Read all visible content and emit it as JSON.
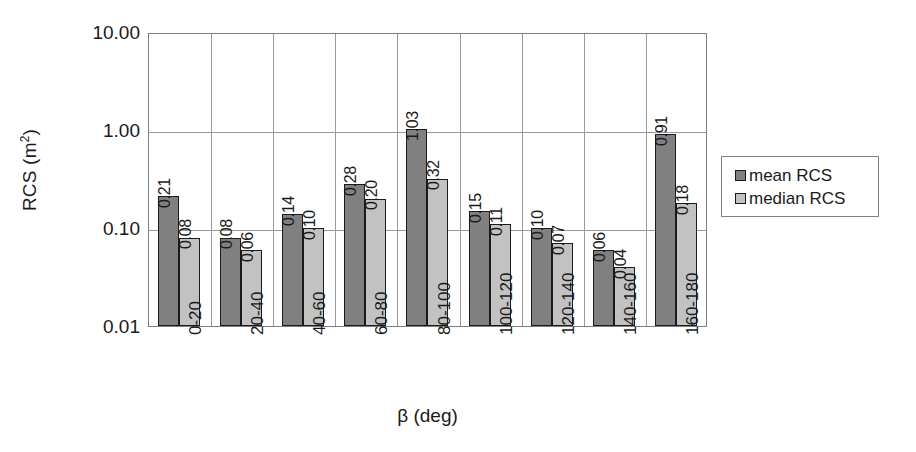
{
  "chart_data": {
    "type": "bar",
    "title": "",
    "xlabel": "β (deg)",
    "ylabel": "RCS (m²)",
    "ylabel_base": "RCS (m",
    "ylabel_sup": "2",
    "ylabel_tail": ")",
    "yscale": "log",
    "ylim": [
      0.01,
      10.0
    ],
    "grid": "both",
    "legend_position": "right",
    "categories": [
      "0-20",
      "20-40",
      "40-60",
      "60-80",
      "80-100",
      "100-120",
      "120-140",
      "140-160",
      "160-180"
    ],
    "y_ticks": [
      "10.00",
      "1.00",
      "0.10",
      "0.01"
    ],
    "y_tick_values": [
      10.0,
      1.0,
      0.1,
      0.01
    ],
    "series": [
      {
        "name": "mean RCS",
        "color": "#808080",
        "values": [
          0.21,
          0.08,
          0.14,
          0.28,
          1.03,
          0.15,
          0.1,
          0.06,
          0.91
        ],
        "labels": [
          "0.21",
          "0.08",
          "0.14",
          "0.28",
          "1.03",
          "0.15",
          "0.10",
          "0.06",
          "0.91"
        ]
      },
      {
        "name": "median RCS",
        "color": "#c2c2c2",
        "values": [
          0.08,
          0.06,
          0.1,
          0.2,
          0.32,
          0.11,
          0.07,
          0.04,
          0.18
        ],
        "labels": [
          "0.08",
          "0.06",
          "0.10",
          "0.20",
          "0.32",
          "0.11",
          "0.07",
          "0.04",
          "0.18"
        ]
      }
    ]
  },
  "legend": {
    "items": [
      {
        "label": "mean RCS",
        "color": "#808080"
      },
      {
        "label": "median RCS",
        "color": "#c2c2c2"
      }
    ]
  },
  "colors": {
    "mean": "#808080",
    "median": "#c2c2c2",
    "grid": "#9a9a9a",
    "axis": "#808080",
    "text": "#1a1a1a",
    "background": "#ffffff"
  }
}
